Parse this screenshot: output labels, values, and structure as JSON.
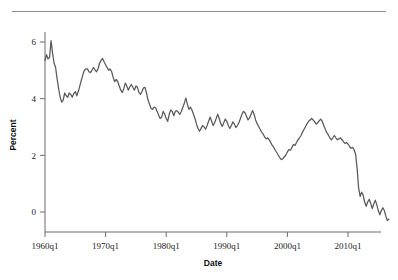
{
  "figure": {
    "rule_color": "#8d8d8d",
    "line_color": "#595959",
    "axis_color": "#6b6b6b",
    "background": "#ffffff"
  },
  "axes": {
    "x_title": "Date",
    "y_title": "Percent",
    "x_tick_labels": [
      "1960q1",
      "1970q1",
      "1980q1",
      "1990q1",
      "2000q1",
      "2010q1"
    ],
    "y_tick_labels": [
      "0",
      "2",
      "4",
      "6"
    ]
  },
  "chart_data": {
    "type": "line",
    "title": "",
    "xlabel": "Date",
    "ylabel": "Percent",
    "xlim": [
      "1960q1",
      "2013q4"
    ],
    "ylim": [
      -0.6,
      6.2
    ],
    "grid": false,
    "legend": null,
    "x_tick_values": [
      "1960q1",
      "1970q1",
      "1980q1",
      "1990q1",
      "2000q1",
      "2010q1"
    ],
    "y_tick_values": [
      0,
      2,
      4,
      6
    ],
    "x_start_year": 1960,
    "x_step_years": 0.25,
    "series": [
      {
        "name": "Percent",
        "values": [
          5.35,
          5.55,
          5.4,
          5.45,
          6.05,
          5.6,
          5.25,
          5.1,
          4.7,
          4.35,
          4.05,
          3.88,
          3.95,
          4.2,
          4.1,
          4.05,
          4.2,
          4.15,
          4.05,
          4.18,
          4.25,
          4.1,
          4.25,
          4.45,
          4.65,
          4.85,
          5.0,
          5.05,
          5.05,
          4.95,
          4.92,
          5.0,
          5.1,
          5.02,
          4.95,
          5.05,
          5.25,
          5.35,
          5.42,
          5.3,
          5.2,
          5.1,
          5.0,
          5.05,
          4.95,
          4.75,
          4.6,
          4.68,
          4.6,
          4.45,
          4.3,
          4.22,
          4.35,
          4.55,
          4.45,
          4.3,
          4.42,
          4.5,
          4.4,
          4.3,
          4.45,
          4.4,
          4.22,
          4.15,
          4.25,
          4.38,
          4.4,
          4.2,
          3.95,
          3.8,
          3.65,
          3.62,
          3.7,
          3.68,
          3.55,
          3.42,
          3.3,
          3.35,
          3.55,
          3.45,
          3.3,
          3.2,
          3.45,
          3.6,
          3.55,
          3.4,
          3.55,
          3.58,
          3.52,
          3.45,
          3.55,
          3.7,
          3.85,
          4.02,
          3.8,
          3.62,
          3.7,
          3.6,
          3.45,
          3.3,
          3.1,
          2.95,
          2.85,
          2.95,
          3.05,
          3.0,
          2.92,
          3.05,
          3.2,
          3.35,
          3.2,
          3.05,
          3.15,
          3.3,
          3.45,
          3.3,
          3.12,
          3.02,
          3.15,
          3.28,
          3.2,
          3.05,
          2.95,
          3.05,
          3.18,
          3.1,
          2.98,
          3.05,
          3.15,
          3.3,
          3.45,
          3.55,
          3.5,
          3.38,
          3.25,
          3.32,
          3.45,
          3.58,
          3.45,
          3.25,
          3.12,
          3.02,
          2.92,
          2.82,
          2.75,
          2.65,
          2.58,
          2.62,
          2.55,
          2.45,
          2.35,
          2.28,
          2.18,
          2.1,
          2.0,
          1.92,
          1.85,
          1.88,
          1.95,
          2.02,
          2.12,
          2.2,
          2.18,
          2.28,
          2.38,
          2.35,
          2.45,
          2.55,
          2.62,
          2.7,
          2.82,
          2.92,
          3.02,
          3.12,
          3.2,
          3.25,
          3.3,
          3.25,
          3.18,
          3.1,
          3.15,
          3.22,
          3.28,
          3.2,
          3.05,
          2.92,
          2.8,
          2.72,
          2.62,
          2.55,
          2.62,
          2.7,
          2.62,
          2.55,
          2.58,
          2.62,
          2.55,
          2.48,
          2.42,
          2.45,
          2.4,
          2.32,
          2.25,
          2.28,
          2.2,
          2.05,
          1.55,
          0.85,
          0.55,
          0.7,
          0.6,
          0.35,
          0.2,
          0.35,
          0.45,
          0.3,
          0.12,
          0.28,
          0.42,
          0.25,
          0.05,
          -0.1,
          0.05,
          0.15,
          0.05,
          -0.15,
          -0.3,
          -0.25
        ]
      }
    ]
  }
}
